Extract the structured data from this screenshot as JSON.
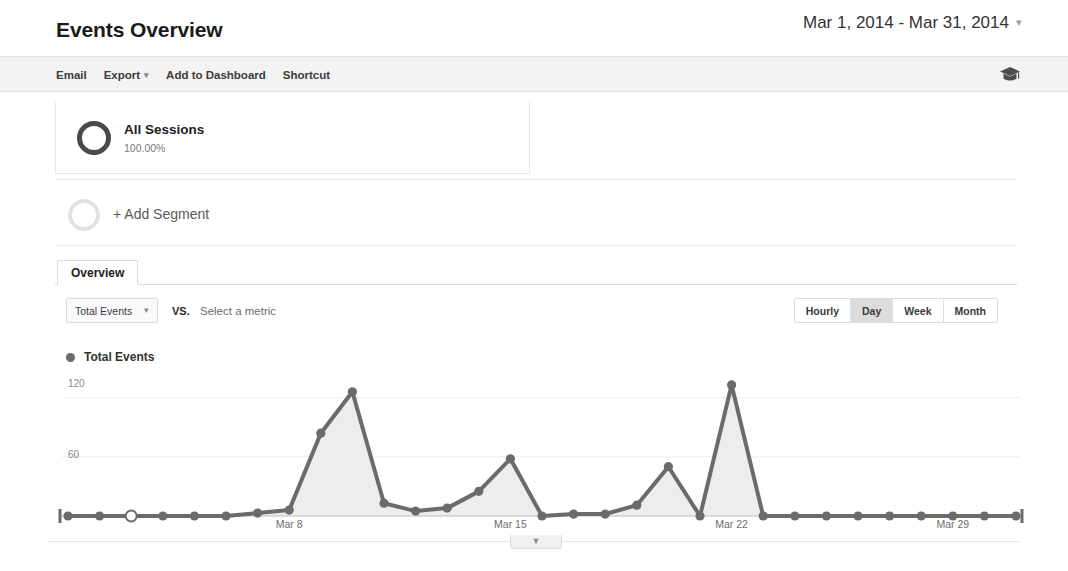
{
  "header": {
    "title": "Events Overview",
    "date_range": "Mar 1, 2014 - Mar 31, 2014",
    "date_caret": "▾"
  },
  "toolbar": {
    "email": "Email",
    "export": "Export",
    "export_caret": "▾",
    "add_to_dashboard": "Add to Dashboard",
    "shortcut": "Shortcut",
    "help_icon": "graduation-cap-icon"
  },
  "segments": {
    "all_sessions": {
      "name": "All Sessions",
      "percent": "100.00%"
    },
    "add_segment_label": "+ Add Segment"
  },
  "tabs": [
    {
      "label": "Overview",
      "active": true
    }
  ],
  "metric_controls": {
    "selected_metric": "Total Events",
    "metric_caret": "▾",
    "vs": "VS.",
    "compare_placeholder": "Select a metric",
    "granularity": [
      {
        "label": "Hourly",
        "active": false
      },
      {
        "label": "Day",
        "active": true
      },
      {
        "label": "Week",
        "active": false
      },
      {
        "label": "Month",
        "active": false
      }
    ]
  },
  "legend": {
    "series_label": "Total Events",
    "dot_color": "#6b6b6b"
  },
  "bottom": {
    "collapse_icon": "chevron-down-icon"
  },
  "chart_data": {
    "type": "area",
    "title": "Total Events",
    "xlabel": "",
    "ylabel": "",
    "ylim": [
      0,
      140
    ],
    "yticks": [
      60,
      120
    ],
    "ytick_labels": [
      "60",
      "120"
    ],
    "grid": true,
    "legend_position": "top-left",
    "line_color": "#6b6b6b",
    "fill_color": "#ededed",
    "x": [
      "Mar 1",
      "Mar 2",
      "Mar 3",
      "Mar 4",
      "Mar 5",
      "Mar 6",
      "Mar 7",
      "Mar 8",
      "Mar 9",
      "Mar 10",
      "Mar 11",
      "Mar 12",
      "Mar 13",
      "Mar 14",
      "Mar 15",
      "Mar 16",
      "Mar 17",
      "Mar 18",
      "Mar 19",
      "Mar 20",
      "Mar 21",
      "Mar 22",
      "Mar 23",
      "Mar 24",
      "Mar 25",
      "Mar 26",
      "Mar 27",
      "Mar 28",
      "Mar 29",
      "Mar 30",
      "Mar 31"
    ],
    "xtick_labels": [
      "Mar 8",
      "Mar 15",
      "Mar 22",
      "Mar 29"
    ],
    "xtick_indices": [
      7,
      14,
      21,
      28
    ],
    "series": [
      {
        "name": "Total Events",
        "values": [
          0,
          0,
          0,
          0,
          0,
          0,
          3,
          6,
          84,
          126,
          13,
          5,
          8,
          25,
          58,
          0,
          2,
          2,
          11,
          50,
          0,
          133,
          0,
          0,
          0,
          0,
          0,
          0,
          0,
          0,
          0
        ]
      }
    ],
    "highlighted_point_index": 2,
    "highlighted_point_style": "hollow-marker"
  }
}
